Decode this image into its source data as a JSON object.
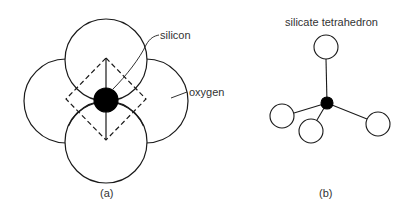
{
  "figure_a": {
    "caption": "(a)",
    "labels": {
      "silicon": "silicon",
      "oxygen": "oxygen"
    },
    "silicon": {
      "cx": 106,
      "cy": 100,
      "r": 12
    },
    "oxygens": [
      {
        "cx": 106,
        "cy": 60,
        "r": 41
      },
      {
        "cx": 106,
        "cy": 142,
        "r": 41
      },
      {
        "cx": 66,
        "cy": 101,
        "r": 42
      },
      {
        "cx": 146,
        "cy": 101,
        "r": 42
      }
    ]
  },
  "figure_b": {
    "title": "silicate tetrahedron",
    "caption": "(b)",
    "silicon": {
      "cx": 327,
      "cy": 103,
      "r": 6
    },
    "oxygens": [
      {
        "cx": 326,
        "cy": 47,
        "r": 12
      },
      {
        "cx": 282,
        "cy": 116,
        "r": 12
      },
      {
        "cx": 311,
        "cy": 131,
        "r": 12
      },
      {
        "cx": 378,
        "cy": 124,
        "r": 12
      }
    ]
  },
  "colors": {
    "stroke": "#1a1a1a",
    "fill": "#ffffff",
    "silicon": "#000000",
    "text": "#333333"
  }
}
